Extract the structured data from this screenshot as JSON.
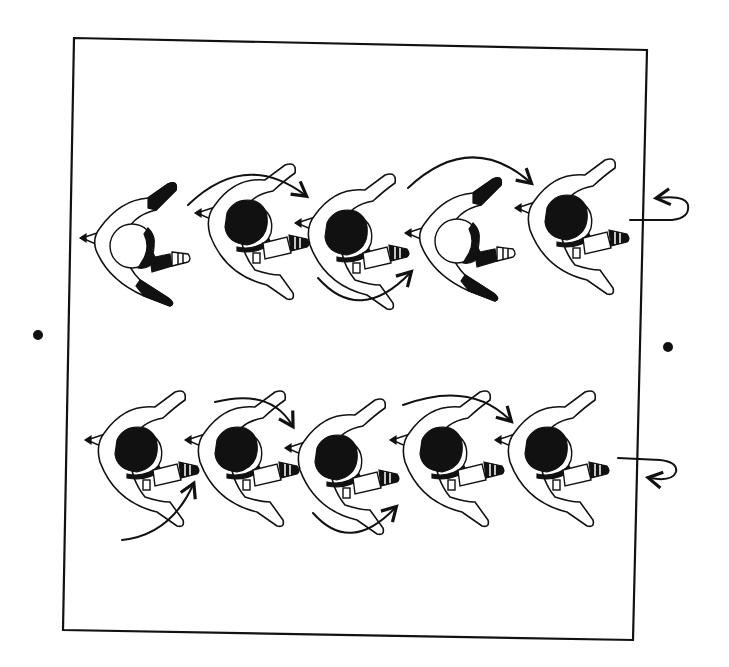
{
  "diagram": {
    "frame": {
      "corners": [
        [
          74,
          38
        ],
        [
          647,
          50
        ],
        [
          633,
          640
        ],
        [
          63,
          630
        ]
      ],
      "stroke": "#111111"
    },
    "markers": [
      {
        "name": "left-dot",
        "x": 38,
        "y": 335
      },
      {
        "name": "right-dot",
        "x": 668,
        "y": 347
      }
    ],
    "rows": [
      {
        "name": "top-row",
        "figures": [
          {
            "x": 130,
            "y": 240,
            "variant": "back",
            "dark_arms": true
          },
          {
            "x": 245,
            "y": 235,
            "variant": "front"
          },
          {
            "x": 345,
            "y": 245,
            "variant": "front"
          },
          {
            "x": 455,
            "y": 235,
            "variant": "back",
            "dark_arms": true
          },
          {
            "x": 565,
            "y": 230,
            "variant": "front"
          }
        ],
        "arrows": [
          {
            "d": "M188,205 Q245,150 305,195",
            "dir": "cw"
          },
          {
            "d": "M318,278 Q360,325 410,273",
            "dir": "ccw"
          },
          {
            "d": "M408,188 Q470,130 530,182",
            "dir": "cw"
          }
        ],
        "turn_marker": {
          "x": 630,
          "y": 220,
          "dir": "left"
        }
      },
      {
        "name": "bottom-row",
        "figures": [
          {
            "x": 135,
            "y": 462,
            "variant": "front"
          },
          {
            "x": 235,
            "y": 462,
            "variant": "front"
          },
          {
            "x": 335,
            "y": 470,
            "variant": "front"
          },
          {
            "x": 440,
            "y": 462,
            "variant": "front"
          },
          {
            "x": 545,
            "y": 462,
            "variant": "front"
          }
        ],
        "arrows": [
          {
            "d": "M122,540 Q170,535 193,485",
            "dir": "ccw"
          },
          {
            "d": "M215,402 Q270,388 292,425",
            "dir": "cw"
          },
          {
            "d": "M313,513 Q350,555 395,508",
            "dir": "ccw"
          },
          {
            "d": "M403,405 Q470,380 510,420",
            "dir": "cw"
          }
        ],
        "turn_marker": {
          "x": 618,
          "y": 458,
          "dir": "right"
        }
      }
    ]
  }
}
